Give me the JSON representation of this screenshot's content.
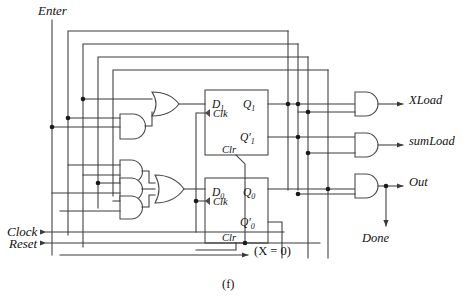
{
  "figure": {
    "caption": "(f)",
    "type": "sequential-logic-circuit-schematic"
  },
  "inputs": [
    {
      "name": "enter",
      "label": "Enter",
      "orientation": "top-vertical"
    },
    {
      "name": "clock",
      "label": "Clock",
      "orientation": "left-arrow"
    },
    {
      "name": "reset",
      "label": "Reset",
      "orientation": "left-arrow"
    },
    {
      "name": "x-equals-zero",
      "label": "(X = 0)",
      "orientation": "right-arrow-pointing-left"
    }
  ],
  "outputs": [
    {
      "name": "xload",
      "label": "XLoad"
    },
    {
      "name": "sumload",
      "label": "sumLoad"
    },
    {
      "name": "out",
      "label": "Out"
    },
    {
      "name": "done",
      "label": "Done"
    }
  ],
  "flipflops": [
    {
      "name": "flipflop-1",
      "d_label": "D",
      "d_sub": "1",
      "clk_label": "Clk",
      "clr_label": "Clr",
      "q_label": "Q",
      "q_sub": "1",
      "qbar_label": "Q′",
      "qbar_sub": "1"
    },
    {
      "name": "flipflop-0",
      "d_label": "D",
      "d_sub": "0",
      "clk_label": "Clk",
      "clr_label": "Clr",
      "q_label": "Q",
      "q_sub": "0",
      "qbar_label": "Q′",
      "qbar_sub": "0"
    }
  ],
  "gates": {
    "and_gates": 7,
    "or_gates": 2,
    "or_gate_inputs": [
      2,
      3
    ],
    "output_and_gates": 3
  },
  "colors": {
    "wire": "#3a3a3a",
    "gate_outline": "#4a4a4a",
    "text": "#111111",
    "background": "#ffffff",
    "junction": "#1a1a1a"
  }
}
